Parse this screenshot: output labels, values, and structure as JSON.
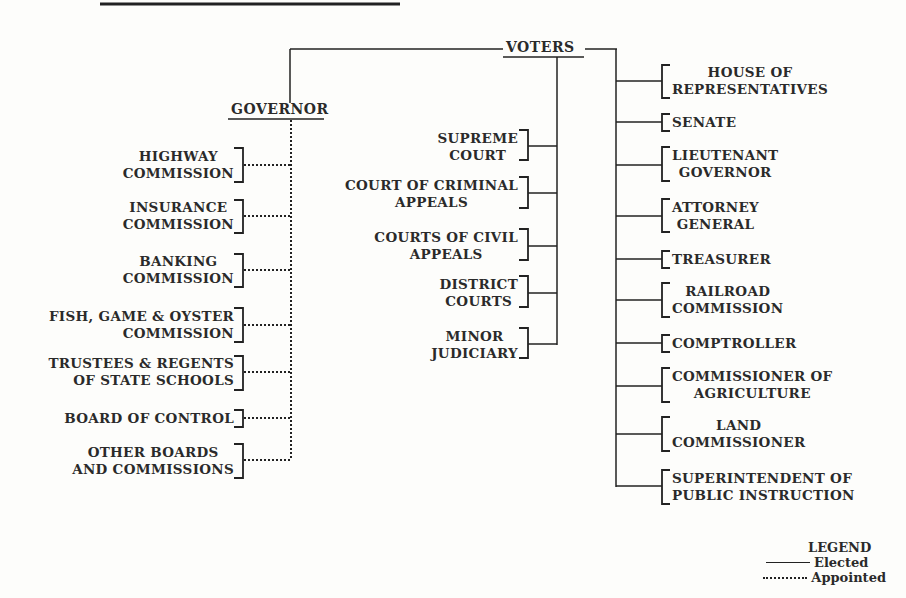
{
  "diagram": {
    "type": "org-chart",
    "root": "VOTERS",
    "governor": {
      "label": "GOVERNOR",
      "appointed": [
        [
          "HIGHWAY",
          "COMMISSION"
        ],
        [
          "INSURANCE",
          "COMMISSION"
        ],
        [
          "BANKING",
          "COMMISSION"
        ],
        [
          "FISH, GAME & OYSTER",
          "COMMISSION"
        ],
        [
          "TRUSTEES & REGENTS",
          "OF STATE SCHOOLS"
        ],
        [
          "BOARD OF CONTROL"
        ],
        [
          "OTHER BOARDS",
          "AND COMMISSIONS"
        ]
      ]
    },
    "judiciary": [
      [
        "SUPREME",
        "COURT"
      ],
      [
        "COURT OF CRIMINAL",
        "APPEALS"
      ],
      [
        "COURTS OF CIVIL",
        "APPEALS"
      ],
      [
        "DISTRICT",
        "COURTS"
      ],
      [
        "MINOR",
        "JUDICIARY"
      ]
    ],
    "elected_offices": [
      [
        "HOUSE OF",
        "REPRESENTATIVES"
      ],
      [
        "SENATE"
      ],
      [
        "LIEUTENANT",
        "GOVERNOR"
      ],
      [
        "ATTORNEY",
        "GENERAL"
      ],
      [
        "TREASURER"
      ],
      [
        "RAILROAD",
        "COMMISSION"
      ],
      [
        "COMPTROLLER"
      ],
      [
        "COMMISSIONER OF",
        "AGRICULTURE"
      ],
      [
        "LAND",
        "COMMISSIONER"
      ],
      [
        "SUPERINTENDENT OF",
        "PUBLIC INSTRUCTION"
      ]
    ],
    "legend": {
      "title": "LEGEND",
      "elected": "Elected",
      "appointed": "Appointed"
    }
  }
}
